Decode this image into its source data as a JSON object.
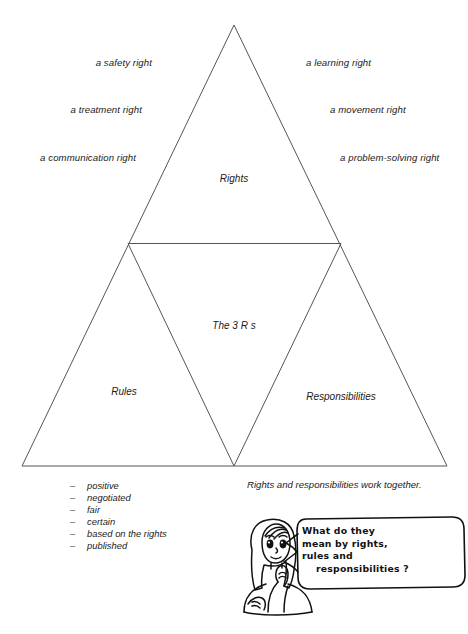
{
  "diagram": {
    "title_zone_top": "Rights",
    "title_zone_center": "The 3 R s",
    "title_zone_left": "Rules",
    "title_zone_right": "Responsibilities",
    "left_labels": [
      {
        "text": "a safety right"
      },
      {
        "text": "a treatment right"
      },
      {
        "text": "a communication right"
      }
    ],
    "right_labels": [
      {
        "text": "a learning right"
      },
      {
        "text": "a movement right"
      },
      {
        "text": "a problem-solving right"
      }
    ],
    "caption": "Rights and responsibilities work together.",
    "rules_attributes": [
      "positive",
      "negotiated",
      "fair",
      "certain",
      "based on the rights",
      "published"
    ],
    "dash_marker": "–"
  },
  "illustration": {
    "character_name": "thinking-girl",
    "speech_bubble": {
      "lines": [
        "What do they",
        "mean by rights,",
        "rules and",
        "responsibilities ?"
      ],
      "full_text": "What do they mean by rights, rules and responsibilities ?"
    }
  },
  "colors": {
    "background": "#ffffff",
    "line": "#555555",
    "ink": "#111111",
    "text": "#1a1a1a"
  }
}
